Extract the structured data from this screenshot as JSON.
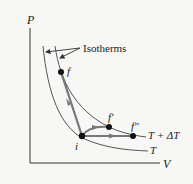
{
  "axes": {
    "y_label": "P",
    "x_label": "V"
  },
  "annotation": "Isotherms",
  "isotherms": [
    {
      "label": "T + ΔT"
    },
    {
      "label": "T"
    }
  ],
  "points": {
    "f": "f",
    "i": "i",
    "f_prime": "f′",
    "f_double_prime": "f″"
  },
  "colors": {
    "curve": "#555555",
    "path": "#777777",
    "point": "#111111",
    "axis": "#333333"
  }
}
